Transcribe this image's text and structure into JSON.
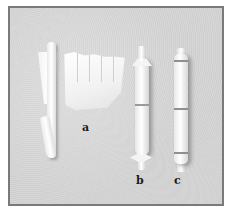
{
  "figure": {
    "labels": [
      "a",
      "b",
      "c"
    ]
  }
}
